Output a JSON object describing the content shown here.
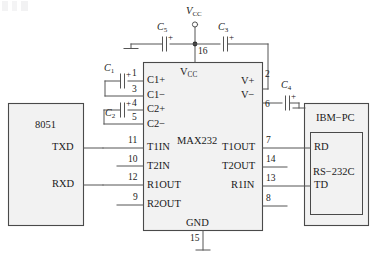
{
  "diagram": {
    "ic": {
      "name": "MAX232",
      "vcc_label": "V",
      "vcc_sub": "CC",
      "vcc_pin": "16",
      "gnd_label": "GND",
      "gnd_pin": "15",
      "left_pins": [
        {
          "num": "1",
          "name": "C1+"
        },
        {
          "num": "3",
          "name": "C1−"
        },
        {
          "num": "4",
          "name": "C2+"
        },
        {
          "num": "5",
          "name": "C2−"
        },
        {
          "num": "11",
          "name": "T1IN"
        },
        {
          "num": "10",
          "name": "T2IN"
        },
        {
          "num": "12",
          "name": "R1OUT"
        },
        {
          "num": "9",
          "name": "R2OUT"
        }
      ],
      "right_pins": [
        {
          "num": "2",
          "name": "V+"
        },
        {
          "num": "6",
          "name": "V−"
        },
        {
          "num": "7",
          "name": "T1OUT"
        },
        {
          "num": "14",
          "name": "T2OUT"
        },
        {
          "num": "13",
          "name": "R1IN"
        },
        {
          "num": "8",
          "name": "R2IN"
        }
      ]
    },
    "supply": {
      "label": "V",
      "sub": "CC",
      "terminal": "open-circle"
    },
    "capacitors": [
      {
        "id": "C1",
        "letter": "C",
        "sub": "1",
        "polarity": "+",
        "position": "left-upper"
      },
      {
        "id": "C2",
        "letter": "C",
        "sub": "2",
        "polarity": "+",
        "position": "left-lower"
      },
      {
        "id": "C3",
        "letter": "C",
        "sub": "3",
        "polarity": "+",
        "position": "top-right"
      },
      {
        "id": "C4",
        "letter": "C",
        "sub": "4",
        "polarity": "+",
        "position": "right"
      },
      {
        "id": "C5",
        "letter": "C",
        "sub": "5",
        "polarity": "+",
        "position": "top-left"
      }
    ],
    "left_block": {
      "name": "8051",
      "pins": [
        "TXD",
        "RXD"
      ]
    },
    "right_block": {
      "name": "IBM−PC",
      "connector": "RS−232C",
      "pins": [
        "RD",
        "TD"
      ]
    },
    "ground_symbols": 3,
    "colors": {
      "line": "#555555",
      "block_fill": "#f2f2f2",
      "block_stroke": "#4a4a4a",
      "text": "#1a1a1a"
    }
  }
}
